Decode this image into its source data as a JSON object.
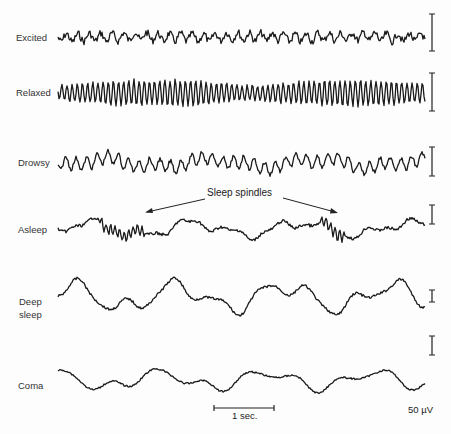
{
  "figure": {
    "states": [
      {
        "label": "Excited",
        "label_pos": [
          16,
          31
        ],
        "baseline_y": 37,
        "amp": 4,
        "freq": 0.55,
        "noise": 3.5,
        "slow_amp": 1,
        "scale_bar": [
          14,
          51
        ]
      },
      {
        "label": "Relaxed",
        "label_pos": [
          16,
          86
        ],
        "baseline_y": 93,
        "amp": 13,
        "freq": 1.22,
        "noise": 1.5,
        "slow_amp": 0,
        "scale_bar": [
          73,
          111
        ]
      },
      {
        "label": "Drowsy",
        "label_pos": [
          18,
          161
        ],
        "baseline_y": 163,
        "amp": 6,
        "freq": 0.6,
        "noise": 2,
        "slow_amp": 6,
        "scale_bar": [
          147,
          176
        ]
      },
      {
        "label": "Asleep",
        "label_pos": [
          18,
          227
        ],
        "baseline_y": 229,
        "amp": 2,
        "freq": 0.3,
        "noise": 1.5,
        "slow_amp": 10,
        "scale_bar": [
          205,
          224
        ]
      },
      {
        "label_lines": [
          "Deep",
          "sleep"
        ],
        "label_pos": [
          19,
          295
        ],
        "baseline_y": 297,
        "amp": 2,
        "freq": 0.25,
        "noise": 1.2,
        "slow_amp": 18,
        "scale_bar": [
          290,
          302
        ]
      },
      {
        "label": "Coma",
        "label_pos": [
          18,
          380
        ],
        "baseline_y": 380,
        "amp": 1,
        "freq": 0.2,
        "noise": 0.8,
        "slow_amp": 12,
        "scale_bar": [
          336,
          355
        ]
      }
    ],
    "annotation": {
      "text": "Sleep spindles",
      "pos": [
        206,
        188
      ]
    },
    "time_scale": {
      "label": "1 sec.",
      "x1": 214,
      "x2": 274,
      "y": 408
    },
    "voltage_scale": {
      "label": "50 µV"
    }
  }
}
